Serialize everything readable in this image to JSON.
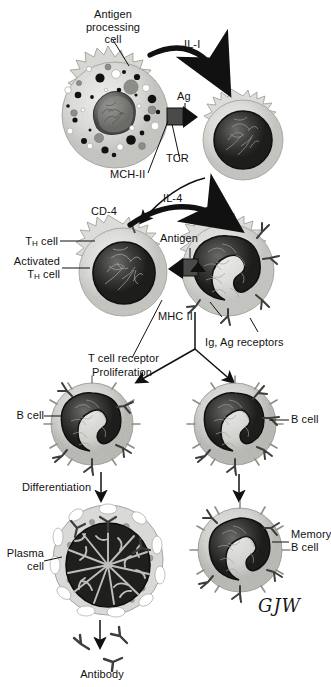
{
  "figure": {
    "signature": "GJW",
    "palette": {
      "ink": "#111111",
      "cytoplasm_light": "#e2e2e0",
      "cytoplasm_mid": "#c9c9c6",
      "nucleus_dark": "#2b2b2b",
      "nucleus_mid": "#6d6d6d",
      "background": "#ffffff"
    }
  },
  "labels": {
    "antigen_processing_cell": "Antigen\nprocessing\ncell",
    "il1": "IL-I",
    "ag": "Ag",
    "tcr": "TCR",
    "mch2": "MCH-II",
    "cd4": "CD-4",
    "il4": "IL-4",
    "th_cell": "T",
    "th_cell_sub": "H",
    "th_cell_tail": " cell",
    "activated": "Activated",
    "antigen": "Antigen",
    "t_cell_receptor": "T cell receptor",
    "mhc2": "MHC II",
    "ig_ag_receptors": "Ig, Ag receptors",
    "proliferation": "Proliferation",
    "b_cell_left": "B cell",
    "b_cell_right": "B cell",
    "differentiation": "Differentiation",
    "plasma_cell": "Plasma\ncell",
    "memory_b_cell": "Memory\nB cell",
    "antibody": "Antibody"
  },
  "cells": [
    {
      "id": "apc",
      "name": "antigen-processing-cell",
      "cx": 115,
      "cy": 115,
      "r": 58
    },
    {
      "id": "t-cell",
      "name": "t-cell-naive",
      "cx": 243,
      "cy": 140,
      "r": 44
    },
    {
      "id": "th-cell",
      "name": "activated-th-cell",
      "cx": 123,
      "cy": 272,
      "r": 48
    },
    {
      "id": "b-cell-mid",
      "name": "b-cell-presenting",
      "cx": 228,
      "cy": 270,
      "r": 50
    },
    {
      "id": "b-cell-l",
      "name": "b-cell-left",
      "cx": 92,
      "cy": 424,
      "r": 44
    },
    {
      "id": "b-cell-r",
      "name": "b-cell-right",
      "cx": 235,
      "cy": 424,
      "r": 44
    },
    {
      "id": "plasma",
      "name": "plasma-cell",
      "cx": 108,
      "cy": 560,
      "r": 57
    },
    {
      "id": "memory",
      "name": "memory-b-cell",
      "cx": 240,
      "cy": 550,
      "r": 44
    }
  ],
  "arrows": [
    {
      "name": "il1-arrow",
      "kind": "curved-thick",
      "from": "apc",
      "to": "t-cell"
    },
    {
      "name": "il4-arrow",
      "kind": "curved-thick",
      "from": "th-cell",
      "to": "b-cell-mid"
    },
    {
      "name": "tcell-to-thcell",
      "kind": "curved-thin",
      "from": "t-cell",
      "to": "th-cell"
    },
    {
      "name": "proliferation-left",
      "kind": "straight",
      "from": "b-cell-mid",
      "to": "b-cell-l"
    },
    {
      "name": "proliferation-right",
      "kind": "straight",
      "from": "b-cell-mid",
      "to": "b-cell-r"
    },
    {
      "name": "differentiation-left",
      "kind": "straight",
      "from": "b-cell-l",
      "to": "plasma"
    },
    {
      "name": "differentiation-right",
      "kind": "straight",
      "from": "b-cell-r",
      "to": "memory"
    },
    {
      "name": "antibody-secretion",
      "kind": "straight",
      "from": "plasma",
      "to": "antibody"
    }
  ]
}
